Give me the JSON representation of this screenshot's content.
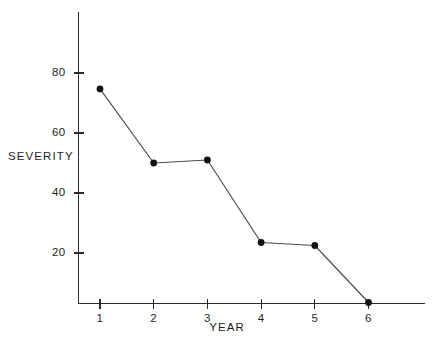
{
  "chart_data": {
    "type": "line",
    "title": "",
    "xlabel": "YEAR",
    "ylabel": "SEVERITY",
    "categories": [
      "1",
      "2",
      "3",
      "4",
      "5",
      "6"
    ],
    "x": [
      1,
      2,
      3,
      4,
      5,
      6
    ],
    "values": [
      74.7,
      50.0,
      51.0,
      23.5,
      22.5,
      3.5
    ],
    "series": [
      {
        "name": "Severity",
        "values": [
          74.7,
          50.0,
          51.0,
          23.5,
          22.5,
          3.5
        ]
      }
    ],
    "xlim": [
      0.62,
      7.05
    ],
    "ylim": [
      0,
      97
    ],
    "x_tick_labels": [
      "1",
      "2",
      "3",
      "4",
      "5",
      "6"
    ],
    "y_tick_labels": [
      "80",
      "60",
      "40",
      "20"
    ],
    "y_ticks": [
      80,
      60,
      40,
      20
    ],
    "grid": false,
    "legend": false,
    "legend_position": "none",
    "marker": "filled-circle",
    "line_color": "#4a4a4a",
    "marker_color": "#121212",
    "axis_color": "#2b2b2b",
    "background_color": "#ffffff"
  },
  "axis": {
    "y_title": "SEVERITY",
    "x_title": "YEAR"
  },
  "ticks": {
    "y": [
      {
        "label": "80",
        "value": 80
      },
      {
        "label": "60",
        "value": 60
      },
      {
        "label": "40",
        "value": 40
      },
      {
        "label": "20",
        "value": 20
      }
    ],
    "x": [
      {
        "label": "1",
        "value": 1
      },
      {
        "label": "2",
        "value": 2
      },
      {
        "label": "3",
        "value": 3
      },
      {
        "label": "4",
        "value": 4
      },
      {
        "label": "5",
        "value": 5
      },
      {
        "label": "6",
        "value": 6
      }
    ]
  }
}
